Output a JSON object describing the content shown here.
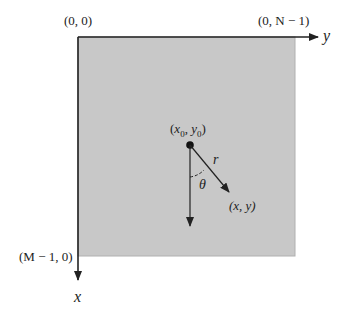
{
  "diagram": {
    "type": "image-coordinate-convention",
    "colors": {
      "background": "#ffffff",
      "image_fill": "#c8c8c8",
      "stroke": "#222222"
    },
    "axes": {
      "horizontal_label": "y",
      "vertical_label": "x"
    },
    "corners": {
      "top_left": "(0, 0)",
      "top_right": "(0, N − 1)",
      "bottom_left": "(M − 1, 0)"
    },
    "center_point": {
      "label_open": "(",
      "x_sym": "x",
      "x_sub": "0",
      "sep": ", ",
      "y_sym": "y",
      "y_sub": "0",
      "label_close": ")"
    },
    "vector": {
      "length_label": "r",
      "angle_label": "θ",
      "end_label": "(x, y)"
    }
  }
}
